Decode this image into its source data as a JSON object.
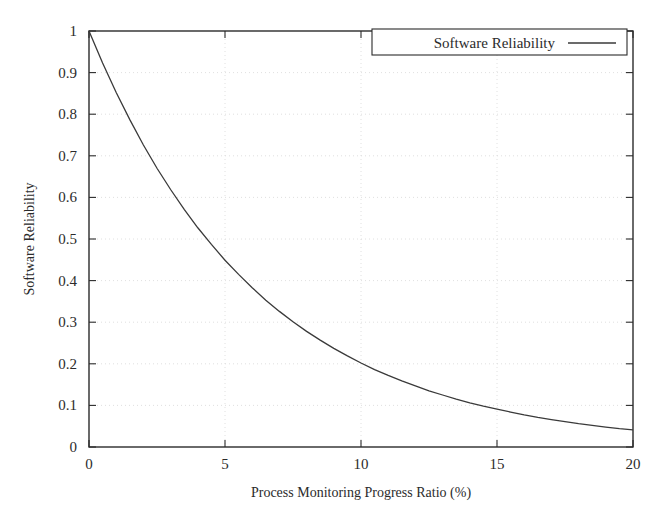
{
  "chart_data": {
    "type": "line",
    "title": "",
    "xlabel": "Process Monitoring Progress Ratio (%)",
    "ylabel": "Software Reliability",
    "xlim": [
      0,
      20
    ],
    "ylim": [
      0,
      1
    ],
    "grid": true,
    "legend_position": "top-right",
    "xticks": [
      0,
      5,
      10,
      15,
      20
    ],
    "xtick_labels": [
      "0",
      "5",
      "10",
      "15",
      "20"
    ],
    "yticks": [
      0,
      0.1,
      0.2,
      0.3,
      0.4,
      0.5,
      0.6,
      0.7,
      0.8,
      0.9,
      1
    ],
    "ytick_labels": [
      "0",
      "0.1",
      "0.2",
      "0.3",
      "0.4",
      "0.5",
      "0.6",
      "0.7",
      "0.8",
      "0.9",
      "1"
    ],
    "series": [
      {
        "name": "Software Reliability",
        "color": "#3a3a3a",
        "x": [
          0,
          0.5,
          1,
          1.5,
          2,
          2.5,
          3,
          3.5,
          4,
          4.5,
          5,
          5.5,
          6,
          6.5,
          7,
          7.5,
          8,
          8.5,
          9,
          9.5,
          10,
          10.5,
          11,
          11.5,
          12,
          12.5,
          13,
          13.5,
          14,
          14.5,
          15,
          15.5,
          16,
          16.5,
          17,
          17.5,
          18,
          18.5,
          19,
          19.5,
          20
        ],
        "values": [
          1.0,
          0.923,
          0.852,
          0.787,
          0.726,
          0.67,
          0.619,
          0.571,
          0.527,
          0.487,
          0.449,
          0.415,
          0.383,
          0.353,
          0.326,
          0.301,
          0.278,
          0.257,
          0.237,
          0.219,
          0.202,
          0.186,
          0.172,
          0.159,
          0.147,
          0.135,
          0.125,
          0.115,
          0.106,
          0.098,
          0.091,
          0.084,
          0.077,
          0.071,
          0.066,
          0.061,
          0.056,
          0.052,
          0.048,
          0.044,
          0.041
        ]
      }
    ]
  },
  "legend": {
    "entries": [
      {
        "label": "Software Reliability",
        "color": "#3a3a3a"
      }
    ]
  },
  "axes": {
    "x_label": "Process Monitoring Progress Ratio (%)",
    "y_label": "Software Reliability"
  }
}
